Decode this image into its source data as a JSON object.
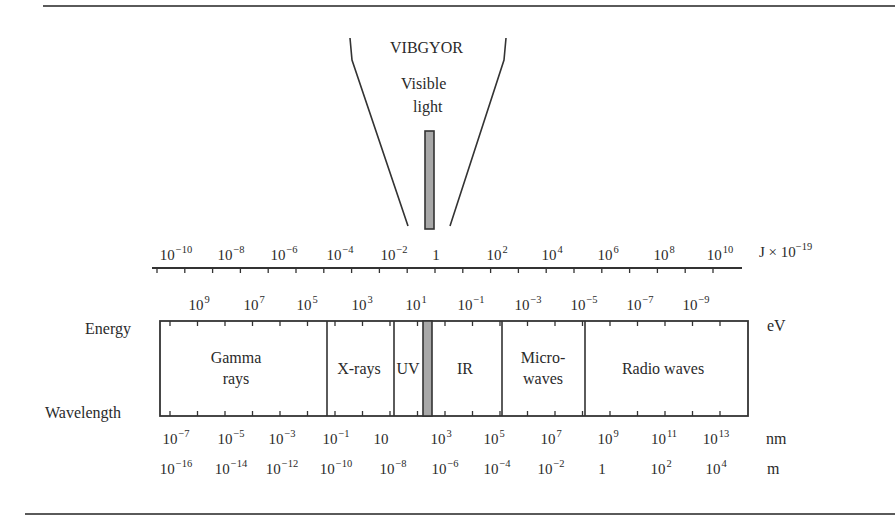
{
  "diagram": {
    "funnel": {
      "top_label": "VIBGYOR",
      "sub_label_line1": "Visible",
      "sub_label_line2": "light"
    },
    "axis_labels": {
      "energy_row": "Energy",
      "wavelength_row": "Wavelength"
    },
    "units": {
      "joule": "J × 10",
      "joule_exp": "−19",
      "ev": "eV",
      "nm": "nm",
      "m": "m"
    },
    "joule_ticks": [
      {
        "base": "10",
        "exp": "−10",
        "x": 176
      },
      {
        "base": "10",
        "exp": "−8",
        "x": 231
      },
      {
        "base": "10",
        "exp": "−6",
        "x": 284
      },
      {
        "base": "10",
        "exp": "−4",
        "x": 340
      },
      {
        "base": "10",
        "exp": "−2",
        "x": 394
      },
      {
        "base": "1",
        "exp": "",
        "x": 436
      },
      {
        "base": "10",
        "exp": "2",
        "x": 497
      },
      {
        "base": "10",
        "exp": "4",
        "x": 552
      },
      {
        "base": "10",
        "exp": "6",
        "x": 608
      },
      {
        "base": "10",
        "exp": "8",
        "x": 664
      },
      {
        "base": "10",
        "exp": "10",
        "x": 720
      }
    ],
    "ev_ticks": [
      {
        "base": "10",
        "exp": "9",
        "x": 199
      },
      {
        "base": "10",
        "exp": "7",
        "x": 254
      },
      {
        "base": "10",
        "exp": "5",
        "x": 307
      },
      {
        "base": "10",
        "exp": "3",
        "x": 362
      },
      {
        "base": "10",
        "exp": "1",
        "x": 416
      },
      {
        "base": "10",
        "exp": "−1",
        "x": 471
      },
      {
        "base": "10",
        "exp": "−3",
        "x": 528
      },
      {
        "base": "10",
        "exp": "−5",
        "x": 584
      },
      {
        "base": "10",
        "exp": "−7",
        "x": 640
      },
      {
        "base": "10",
        "exp": "−9",
        "x": 696
      }
    ],
    "nm_ticks": [
      {
        "base": "10",
        "exp": "−7",
        "x": 176
      },
      {
        "base": "10",
        "exp": "−5",
        "x": 231
      },
      {
        "base": "10",
        "exp": "−3",
        "x": 282
      },
      {
        "base": "10",
        "exp": "−1",
        "x": 336
      },
      {
        "base": "10",
        "exp": "",
        "x": 381
      },
      {
        "base": "10",
        "exp": "3",
        "x": 441
      },
      {
        "base": "10",
        "exp": "5",
        "x": 494
      },
      {
        "base": "10",
        "exp": "7",
        "x": 551
      },
      {
        "base": "10",
        "exp": "9",
        "x": 608
      },
      {
        "base": "10",
        "exp": "11",
        "x": 664
      },
      {
        "base": "10",
        "exp": "13",
        "x": 716
      }
    ],
    "m_ticks": [
      {
        "base": "10",
        "exp": "−16",
        "x": 176
      },
      {
        "base": "10",
        "exp": "−14",
        "x": 231
      },
      {
        "base": "10",
        "exp": "−12",
        "x": 282
      },
      {
        "base": "10",
        "exp": "−10",
        "x": 336
      },
      {
        "base": "10",
        "exp": "−8",
        "x": 393
      },
      {
        "base": "10",
        "exp": "−6",
        "x": 445
      },
      {
        "base": "10",
        "exp": "−4",
        "x": 497
      },
      {
        "base": "10",
        "exp": "−2",
        "x": 551
      },
      {
        "base": "1",
        "exp": "",
        "x": 602
      },
      {
        "base": "10",
        "exp": "2",
        "x": 661
      },
      {
        "base": "10",
        "exp": "4",
        "x": 716
      }
    ],
    "regions": [
      {
        "line1": "Gamma",
        "line2": "rays",
        "cx": 236
      },
      {
        "line1": "X-rays",
        "line2": "",
        "cx": 359
      },
      {
        "line1": "UV",
        "line2": "",
        "cx": 408
      },
      {
        "line1": "IR",
        "line2": "",
        "cx": 465
      },
      {
        "line1": "Micro-",
        "line2": "waves",
        "cx": 543
      },
      {
        "line1": "Radio waves",
        "line2": "",
        "cx": 663
      }
    ],
    "colors": {
      "line": "#333333",
      "visible_band": "#a8a8a8",
      "rule": "#5a5a5a"
    }
  }
}
